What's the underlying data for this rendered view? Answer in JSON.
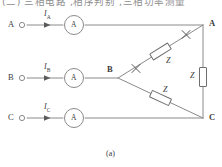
{
  "figure": {
    "caption": "(a)",
    "cropped_header_text": "(二) 三相电路 ,相序判别 ,三相功率测量",
    "terminals": [
      {
        "id": "A",
        "label": "A",
        "y": 25
      },
      {
        "id": "B",
        "label": "B",
        "y": 78
      },
      {
        "id": "C",
        "label": "C",
        "y": 118
      }
    ],
    "currents": [
      {
        "id": "IA",
        "symbol": "I",
        "subscript": "A"
      },
      {
        "id": "IB",
        "symbol": "I",
        "subscript": "B"
      },
      {
        "id": "IC",
        "symbol": "I",
        "subscript": "C"
      }
    ],
    "meters": [
      {
        "id": "ammeter-a",
        "label": "A"
      },
      {
        "id": "ammeter-b",
        "label": "A"
      },
      {
        "id": "ammeter-c",
        "label": "A"
      }
    ],
    "nodes": [
      {
        "id": "node-A",
        "label": "A"
      },
      {
        "id": "node-B",
        "label": "B"
      },
      {
        "id": "node-C",
        "label": "C"
      }
    ],
    "impedances": [
      {
        "id": "z-ab",
        "label": "Z",
        "branch": "B-A"
      },
      {
        "id": "z-bc",
        "label": "Z",
        "branch": "B-C"
      },
      {
        "id": "z-ca",
        "label": "Z",
        "branch": "A-C"
      }
    ],
    "break_marks": [
      {
        "id": "break-mark-b-side"
      },
      {
        "id": "break-mark-a-side"
      }
    ],
    "colors": {
      "line": "#8a8a8a",
      "text": "#3b3b3b",
      "background": "#ffffff",
      "header_text": "#8e8e8e"
    }
  }
}
